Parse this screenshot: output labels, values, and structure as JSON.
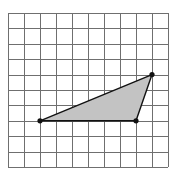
{
  "diagram": {
    "type": "grid-with-polygon",
    "grid": {
      "columns": 10,
      "rows": 10,
      "origin_px": [
        8,
        13
      ],
      "cell_width_px": 16,
      "cell_height_px": 15.4,
      "line_color": "#6f6f6f",
      "background": "#ffffff"
    },
    "shape": {
      "kind": "triangle",
      "fill": "#c3c3c3",
      "stroke": "#111111",
      "vertices_grid": [
        {
          "label": "A",
          "col": 2,
          "row": 7
        },
        {
          "label": "B",
          "col": 8,
          "row": 7
        },
        {
          "label": "C",
          "col": 9,
          "row": 4
        }
      ],
      "vertex_marker": "dot"
    }
  }
}
